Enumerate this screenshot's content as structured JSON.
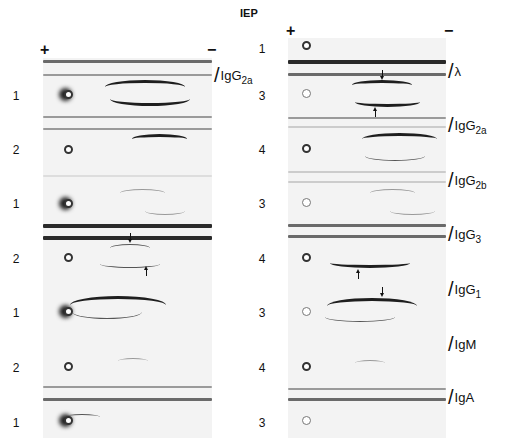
{
  "header": {
    "title": "IEP",
    "plus": "+",
    "minus": "−"
  },
  "left_column": {
    "row_numbers": [
      "1",
      "2",
      "1",
      "2",
      "1",
      "2",
      "1"
    ]
  },
  "right_column": {
    "row_numbers": [
      "1",
      "3",
      "4",
      "3",
      "4",
      "3",
      "4",
      "3"
    ]
  },
  "antisera_labels": {
    "left": [
      {
        "name": "IgG",
        "sub": "2a"
      }
    ],
    "right": [
      {
        "name": "λ",
        "sub": ""
      },
      {
        "name": "IgG",
        "sub": "2a"
      },
      {
        "name": "IgG",
        "sub": "2b"
      },
      {
        "name": "IgG",
        "sub": "3"
      },
      {
        "name": "IgG",
        "sub": "1"
      },
      {
        "name": "IgM",
        "sub": ""
      },
      {
        "name": "IgA",
        "sub": ""
      }
    ]
  },
  "colors": {
    "band": "#1e1e1e",
    "gel": "#f3f3f3",
    "trough": "#2a2a2a"
  }
}
